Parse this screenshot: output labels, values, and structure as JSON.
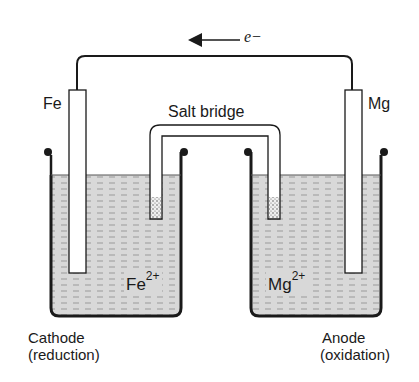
{
  "diagram": {
    "electron_flow": {
      "symbol": "e",
      "charge": "−",
      "direction": "left"
    },
    "electrodes": {
      "left": {
        "label": "Fe"
      },
      "right": {
        "label": "Mg"
      }
    },
    "salt_bridge": {
      "label": "Salt bridge"
    },
    "ions": {
      "left": {
        "symbol": "Fe",
        "charge": "2+"
      },
      "right": {
        "symbol": "Mg",
        "charge": "2+"
      }
    },
    "beakers": {
      "left": {
        "role": "Cathode",
        "process": "(reduction)"
      },
      "right": {
        "role": "Anode",
        "process": "(oxidation)"
      }
    },
    "colors": {
      "line": "#1a1a1a",
      "solution": "#d8d8d8",
      "background": "#ffffff"
    }
  }
}
